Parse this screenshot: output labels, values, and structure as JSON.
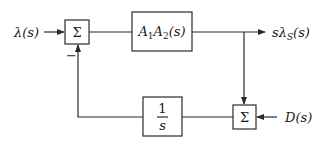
{
  "diagram": {
    "type": "block-diagram",
    "input_label": "λ(s)",
    "output_label": "sλS(s)",
    "disturbance_label": "D(s)",
    "summing_junction_1": {
      "symbol": "Σ",
      "feedback_sign": "−"
    },
    "forward_block": {
      "label": "A1A2(s)",
      "main": "A",
      "sub1": "1",
      "main2": "A",
      "sub2": "2",
      "tail": "(s)"
    },
    "feedback_block": {
      "numerator": "1",
      "denominator": "s"
    },
    "summing_junction_2": {
      "symbol": "Σ"
    },
    "output": {
      "prefix": "sλ",
      "sub": "S",
      "tail": "(s)"
    }
  }
}
